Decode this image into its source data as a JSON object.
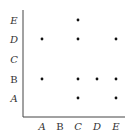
{
  "chart_data": {
    "type": "scatter",
    "title": "",
    "xlabel": "",
    "ylabel": "",
    "x_categories": [
      "A",
      "B",
      "C",
      "D",
      "E"
    ],
    "y_categories": [
      "A",
      "B",
      "C",
      "D",
      "E"
    ],
    "points": [
      {
        "x": "C",
        "y": "E"
      },
      {
        "x": "A",
        "y": "D"
      },
      {
        "x": "C",
        "y": "D"
      },
      {
        "x": "E",
        "y": "D"
      },
      {
        "x": "A",
        "y": "B"
      },
      {
        "x": "C",
        "y": "B"
      },
      {
        "x": "D",
        "y": "B"
      },
      {
        "x": "E",
        "y": "B"
      },
      {
        "x": "C",
        "y": "A"
      },
      {
        "x": "E",
        "y": "A"
      }
    ],
    "grid": false,
    "legend": null
  },
  "style": {
    "axis_color": "#444444",
    "point_color": "#111111",
    "label_color": "#333333"
  }
}
